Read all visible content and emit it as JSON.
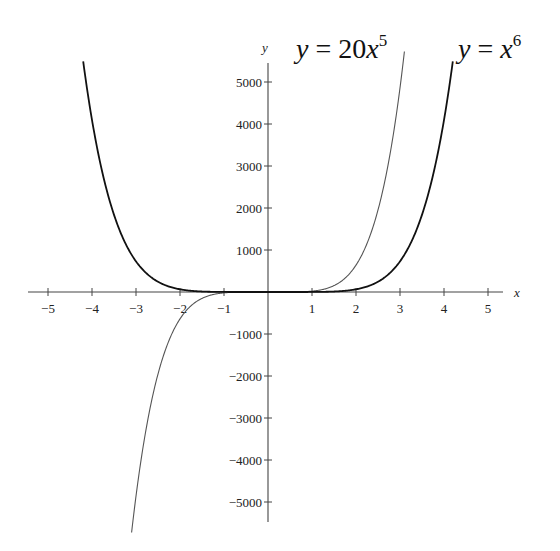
{
  "chart_data": {
    "type": "line",
    "title": "",
    "xlabel": "x",
    "ylabel": "y",
    "xlim": [
      -5.5,
      5.5
    ],
    "ylim": [
      -5500,
      5500
    ],
    "grid": false,
    "legend": "inline labels at top of curves",
    "x_ticks": [
      -5,
      -4,
      -3,
      -2,
      -1,
      1,
      2,
      3,
      4,
      5
    ],
    "y_ticks": [
      -5000,
      -4000,
      -3000,
      -2000,
      -1000,
      1000,
      2000,
      3000,
      4000,
      5000
    ],
    "x_tick_labels": [
      "−5",
      "−4",
      "−3",
      "−2",
      "−1",
      "1",
      "2",
      "3",
      "4",
      "5"
    ],
    "y_tick_labels": [
      "−5000",
      "−4000",
      "−3000",
      "−2000",
      "−1000",
      "1000",
      "2000",
      "3000",
      "4000",
      "5000"
    ],
    "series": [
      {
        "name": "y = 20x^5",
        "label_text": "y = 20x",
        "label_exponent": "5",
        "formula": "20*x^5",
        "stroke": "#555555",
        "stroke_width": 1.1,
        "x": [
          -3.1,
          -3,
          -2.5,
          -2,
          -1.5,
          -1,
          0,
          1,
          1.5,
          2,
          2.5,
          3,
          3.1
        ],
        "values": [
          -5726,
          -4860,
          -1953,
          -640,
          -152,
          -20,
          0,
          20,
          152,
          640,
          1953,
          4860,
          5726
        ]
      },
      {
        "name": "y = x^6",
        "label_text": "y = x",
        "label_exponent": "6",
        "formula": "x^6",
        "stroke": "#111111",
        "stroke_width": 1.8,
        "x": [
          -4.2,
          -4,
          -3.5,
          -3,
          -2.5,
          -2,
          -1,
          0,
          1,
          2,
          2.5,
          3,
          3.5,
          4,
          4.2
        ],
        "values": [
          5489,
          4096,
          1838,
          729,
          244,
          64,
          1,
          0,
          1,
          64,
          244,
          729,
          1838,
          4096,
          5489
        ]
      }
    ]
  },
  "layout": {
    "origin_px": [
      268,
      292
    ],
    "px_per_x_unit": 44,
    "px_per_y_unit": 0.042,
    "x_axis_px": [
      28,
      503
    ],
    "y_axis_px": [
      63,
      522
    ]
  }
}
